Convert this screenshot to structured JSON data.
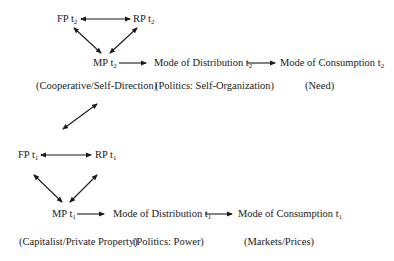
{
  "diagram": {
    "period_t2": {
      "fp": {
        "label": "FP t",
        "sub": "2"
      },
      "rp": {
        "label": "RP t",
        "sub": "2"
      },
      "mp": {
        "label": "MP t",
        "sub": "2"
      },
      "distribution": {
        "label": "Mode of Distribution t",
        "sub": "2"
      },
      "consumption": {
        "label": "Mode of Consumption t",
        "sub": "2"
      },
      "mp_caption": "(Cooperative/Self-Direction)",
      "distribution_caption": "(Politics: Self-Organization)",
      "consumption_caption": "(Need)"
    },
    "period_t1": {
      "fp": {
        "label": "FP t",
        "sub": "1"
      },
      "rp": {
        "label": "RP t",
        "sub": "1"
      },
      "mp": {
        "label": "MP t",
        "sub": "1"
      },
      "distribution": {
        "label": "Mode of Distribution t",
        "sub": "1"
      },
      "consumption": {
        "label": "Mode of Consumption t",
        "sub": "1"
      },
      "mp_caption": "(Capitalist/Private Property)",
      "distribution_caption": "(Politics: Power)",
      "consumption_caption": "(Markets/Prices)"
    },
    "colors": {
      "ink": "#1a1a1a",
      "background": "#ffffff"
    }
  }
}
